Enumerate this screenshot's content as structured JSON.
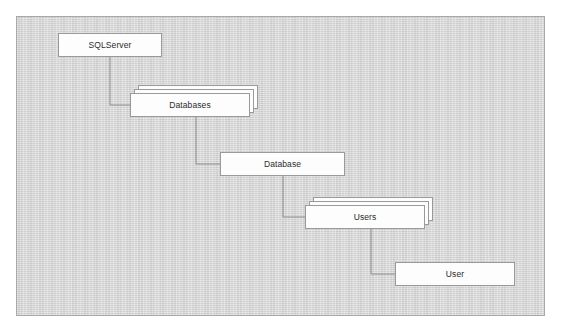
{
  "diagram": {
    "type": "object-hierarchy-tree",
    "panel": {
      "background_color": "#d2d2d2",
      "border_color": "#a8a8a8",
      "x": 16,
      "y": 16,
      "width": 529,
      "height": 300
    },
    "style": {
      "node_fill": "#fdfdfd",
      "node_border": "#9a9a9a",
      "label_color": "#2b2b2b",
      "connector_color": "#8c8c8c"
    },
    "nodes": [
      {
        "id": "sqlserver",
        "label": "SQLServer",
        "kind": "single",
        "x": 58,
        "y": 33,
        "width": 104,
        "height": 24
      },
      {
        "id": "databases",
        "label": "Databases",
        "kind": "collection",
        "layers": 3,
        "x": 130,
        "y": 93,
        "width": 120,
        "height": 24
      },
      {
        "id": "database",
        "label": "Database",
        "kind": "single",
        "x": 220,
        "y": 152,
        "width": 125,
        "height": 24
      },
      {
        "id": "users",
        "label": "Users",
        "kind": "collection",
        "layers": 3,
        "x": 305,
        "y": 205,
        "width": 120,
        "height": 24
      },
      {
        "id": "user",
        "label": "User",
        "kind": "single",
        "x": 395,
        "y": 262,
        "width": 120,
        "height": 24
      }
    ],
    "connectors": [
      {
        "id": "sqlserver-to-databases",
        "from": "sqlserver",
        "to": "databases",
        "points": "110,57 110,105 130,105"
      },
      {
        "id": "databases-to-database",
        "from": "databases",
        "to": "database",
        "points": "196,117 196,164 220,164"
      },
      {
        "id": "database-to-users",
        "from": "database",
        "to": "users",
        "points": "283,176 283,217 305,217"
      },
      {
        "id": "users-to-user",
        "from": "users",
        "to": "user",
        "points": "371,229 371,274 395,274"
      }
    ]
  }
}
